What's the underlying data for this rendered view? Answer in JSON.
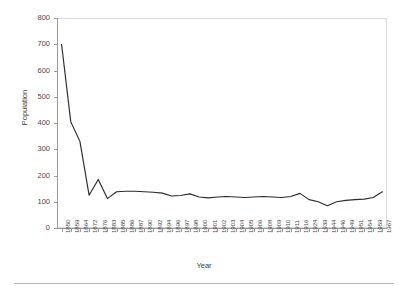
{
  "chart_data": {
    "type": "line",
    "title": "",
    "xlabel": "Year",
    "ylabel": "Population",
    "ylim": [
      0,
      800
    ],
    "ytick_values": [
      0,
      100,
      200,
      300,
      400,
      500,
      600,
      700,
      800
    ],
    "grid": false,
    "legend": false,
    "line_color": "#2b2b2b",
    "frame_color": "#d9d9d9",
    "axis_color": "#9a9a9a",
    "categories": [
      "1850",
      "1859",
      "1864",
      "1872",
      "1876",
      "1883",
      "1885",
      "1886",
      "1887",
      "1890",
      "1892",
      "1894",
      "1896",
      "1897",
      "1898",
      "1900",
      "1901",
      "1902",
      "1903",
      "1904",
      "1905",
      "1906",
      "1908",
      "1909",
      "1910",
      "1911",
      "1916",
      "1924",
      "1939",
      "1944",
      "1946",
      "1949",
      "1951",
      "1954",
      "1959",
      "1967"
    ],
    "series": [
      {
        "name": "Population",
        "values": [
          700,
          405,
          330,
          125,
          185,
          112,
          138,
          140,
          140,
          138,
          136,
          133,
          122,
          124,
          130,
          118,
          115,
          118,
          120,
          118,
          116,
          118,
          120,
          118,
          116,
          120,
          132,
          108,
          100,
          85,
          100,
          105,
          108,
          110,
          116,
          138
        ]
      }
    ]
  },
  "figure": {
    "y_axis_title": "Population",
    "x_axis_title": "Year"
  }
}
